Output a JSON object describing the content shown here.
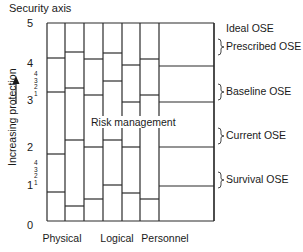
{
  "axis": {
    "title": "Security axis",
    "ylabel": "Increasing protection",
    "ticks": [
      {
        "label": "5",
        "y": 24
      },
      {
        "label": "4",
        "y": 64
      },
      {
        "label": "3",
        "y": 101
      },
      {
        "label": "2",
        "y": 148
      },
      {
        "label": "1",
        "y": 186
      },
      {
        "label": "0",
        "y": 226
      }
    ],
    "subticks_upper": [
      "4",
      "3",
      "2",
      "1"
    ],
    "subticks_lower": [
      "4",
      "3",
      "2",
      "1"
    ]
  },
  "categories": [
    {
      "label": "Physical",
      "x": 62
    },
    {
      "label": "Logical",
      "x": 117
    },
    {
      "label": "Personnel",
      "x": 165
    }
  ],
  "annotation": "Risk management",
  "ose_levels": [
    {
      "label": "Ideal OSE",
      "y": 29,
      "brace": false
    },
    {
      "label": "Prescribed OSE",
      "y": 47,
      "brace": true
    },
    {
      "label": "Baseline OSE",
      "y": 92,
      "brace": true
    },
    {
      "label": "Current OSE",
      "y": 136,
      "brace": true
    },
    {
      "label": "Survival OSE",
      "y": 180,
      "brace": true
    }
  ],
  "grid": {
    "left": 47,
    "right": 214,
    "top": 23,
    "bottom": 221,
    "columns": [
      {
        "x0": 47,
        "x1": 65,
        "lines": [
          58,
          92,
          154,
          192
        ]
      },
      {
        "x0": 65,
        "x1": 84,
        "lines": [
          52,
          88,
          140,
          206
        ]
      },
      {
        "x0": 84,
        "x1": 103,
        "lines": [
          59,
          95,
          147,
          199
        ]
      },
      {
        "x0": 103,
        "x1": 122,
        "lines": [
          53,
          81,
          140,
          185
        ]
      },
      {
        "x0": 122,
        "x1": 140,
        "lines": [
          65,
          102,
          147,
          193
        ]
      },
      {
        "x0": 140,
        "x1": 159,
        "lines": [
          59,
          95,
          199
        ]
      },
      {
        "x0": 159,
        "x1": 214,
        "lines": [
          66,
          102,
          147,
          186
        ]
      }
    ]
  }
}
